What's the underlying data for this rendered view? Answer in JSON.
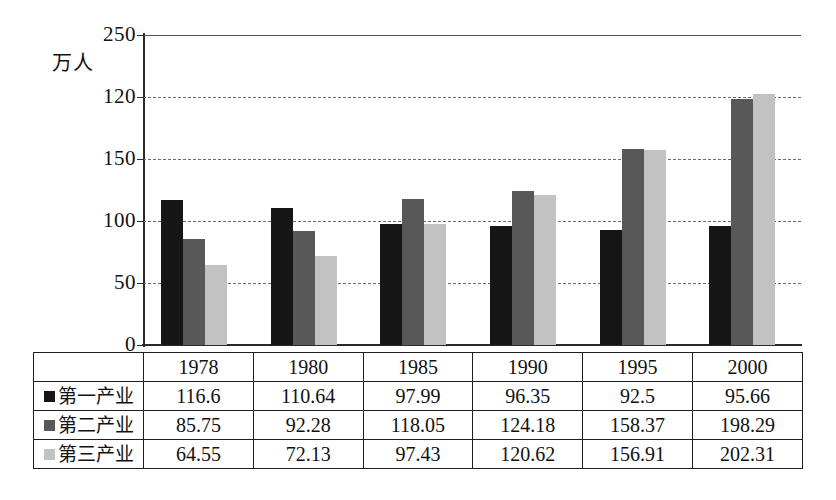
{
  "chart_data": {
    "type": "bar",
    "title": "",
    "xlabel": "",
    "ylabel": "万人",
    "ylim": [
      0,
      250
    ],
    "grid": true,
    "legend_position": "table-row-labels",
    "categories": [
      "1978",
      "1980",
      "1985",
      "1990",
      "1995",
      "2000"
    ],
    "ytick_labels": [
      "250",
      "120",
      "150",
      "100",
      "50",
      "0"
    ],
    "ytick_values": [
      250,
      200,
      150,
      100,
      50,
      0
    ],
    "series": [
      {
        "name": "第一产业",
        "color": "#161616",
        "values": [
          116.6,
          110.64,
          97.99,
          96.35,
          92.5,
          95.66
        ],
        "value_labels": [
          "116.6",
          "110.64",
          "97.99",
          "96.35",
          "92.5",
          "95.66"
        ]
      },
      {
        "name": "第二产业",
        "color": "#585858",
        "values": [
          85.75,
          92.28,
          118.05,
          124.18,
          158.37,
          198.29
        ],
        "value_labels": [
          "85.75",
          "92.28",
          "118.05",
          "124.18",
          "158.37",
          "198.29"
        ]
      },
      {
        "name": "第三产业",
        "color": "#c2c2c2",
        "values": [
          64.55,
          72.13,
          97.43,
          120.62,
          156.91,
          202.31
        ],
        "value_labels": [
          "64.55",
          "72.13",
          "97.43",
          "120.62",
          "156.91",
          "202.31"
        ]
      }
    ]
  },
  "table": {
    "corner_label": "",
    "column_headers": [
      "1978",
      "1980",
      "1985",
      "1990",
      "1995",
      "2000"
    ],
    "rows": [
      {
        "label": "第一产业",
        "swatch_color": "#161616",
        "cells": [
          "116.6",
          "110.64",
          "97.99",
          "96.35",
          "92.5",
          "95.66"
        ]
      },
      {
        "label": "第二产业",
        "swatch_color": "#585858",
        "cells": [
          "85.75",
          "92.28",
          "118.05",
          "124.18",
          "158.37",
          "198.29"
        ]
      },
      {
        "label": "第三产业",
        "swatch_color": "#c2c2c2",
        "cells": [
          "64.55",
          "72.13",
          "97.43",
          "120.62",
          "156.91",
          "202.31"
        ]
      }
    ]
  }
}
